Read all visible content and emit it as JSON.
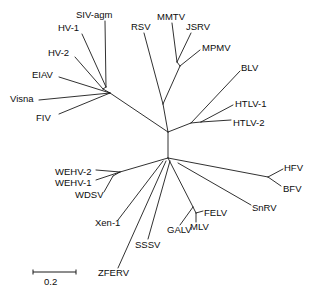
{
  "figure": {
    "type": "unrooted-phylogenetic-tree",
    "title": "",
    "width": 312,
    "height": 298,
    "background_color": "#ffffff",
    "line_color": "#1a1a1a",
    "text_color": "#0d0d0d"
  },
  "scale_bar": {
    "label": "0.2",
    "value": 0.2,
    "x1": 33,
    "x2": 76,
    "y": 272,
    "tick_height": 5,
    "label_x": 44,
    "label_y": 277
  },
  "taxa": [
    {
      "name": "SIV-agm",
      "label": "SIV-agm",
      "label_x": 76,
      "label_y": 10,
      "tip_x": 106,
      "tip_y": 87,
      "leader": [
        [
          105,
          21
        ],
        [
          106,
          87
        ]
      ]
    },
    {
      "name": "HV-1",
      "label": "HV-1",
      "label_x": 58,
      "label_y": 23,
      "tip_x": 106,
      "tip_y": 87,
      "leader": [
        [
          82,
          34
        ],
        [
          106,
          87
        ]
      ]
    },
    {
      "name": "HV-2",
      "label": "HV-2",
      "label_x": 48,
      "label_y": 48,
      "tip_x": 103,
      "tip_y": 89,
      "leader": [
        [
          75,
          57
        ],
        [
          103,
          89
        ]
      ]
    },
    {
      "name": "EIAV",
      "label": "EIAV",
      "label_x": 32,
      "label_y": 70,
      "tip_x": 110,
      "tip_y": 93,
      "leader": [
        [
          59,
          77
        ],
        [
          110,
          93
        ]
      ]
    },
    {
      "name": "Visna",
      "label": "Visna",
      "label_x": 10,
      "label_y": 94,
      "tip_x": 110,
      "tip_y": 93,
      "leader": [
        [
          39,
          100
        ],
        [
          110,
          93
        ]
      ]
    },
    {
      "name": "FIV",
      "label": "FIV",
      "label_x": 36,
      "label_y": 113,
      "tip_x": 110,
      "tip_y": 93,
      "leader": [
        [
          59,
          114
        ],
        [
          110,
          93
        ]
      ]
    },
    {
      "name": "RSV",
      "label": "RSV",
      "label_x": 131,
      "label_y": 22,
      "tip_x": 163,
      "tip_y": 104,
      "leader": [
        [
          144,
          33
        ],
        [
          163,
          104
        ]
      ]
    },
    {
      "name": "MMTV",
      "label": "MMTV",
      "label_x": 157,
      "label_y": 12,
      "tip_x": 177,
      "tip_y": 62,
      "leader": [
        [
          172,
          23
        ],
        [
          177,
          62
        ]
      ]
    },
    {
      "name": "JSRV",
      "label": "JSRV",
      "label_x": 186,
      "label_y": 22,
      "tip_x": 177,
      "tip_y": 62,
      "leader": [
        [
          191,
          33
        ],
        [
          177,
          62
        ]
      ]
    },
    {
      "name": "MPMV",
      "label": "MPMV",
      "label_x": 202,
      "label_y": 43,
      "tip_x": 180,
      "tip_y": 66,
      "leader": [
        [
          200,
          50
        ],
        [
          180,
          66
        ]
      ]
    },
    {
      "name": "BLV",
      "label": "BLV",
      "label_x": 241,
      "label_y": 63,
      "tip_x": 191,
      "tip_y": 123,
      "leader": [
        [
          240,
          71
        ],
        [
          191,
          123
        ]
      ]
    },
    {
      "name": "HTLV-1",
      "label": "HTLV-1",
      "label_x": 235,
      "label_y": 99,
      "tip_x": 201,
      "tip_y": 122,
      "leader": [
        [
          233,
          105
        ],
        [
          201,
          122
        ]
      ]
    },
    {
      "name": "HTLV-2",
      "label": "HTLV-2",
      "label_x": 233,
      "label_y": 118,
      "tip_x": 201,
      "tip_y": 122,
      "leader": [
        [
          231,
          120
        ],
        [
          201,
          122
        ]
      ]
    },
    {
      "name": "HFV",
      "label": "HFV",
      "label_x": 284,
      "label_y": 163,
      "tip_x": 268,
      "tip_y": 177,
      "leader": [
        [
          283,
          169
        ],
        [
          268,
          177
        ]
      ]
    },
    {
      "name": "BFV",
      "label": "BFV",
      "label_x": 283,
      "label_y": 184,
      "tip_x": 268,
      "tip_y": 177,
      "leader": [
        [
          281,
          186
        ],
        [
          268,
          177
        ]
      ]
    },
    {
      "name": "SnRV",
      "label": "SnRV",
      "label_x": 252,
      "label_y": 203,
      "tip_x": 178,
      "tip_y": 163,
      "leader": [
        [
          251,
          205
        ],
        [
          178,
          163
        ]
      ]
    },
    {
      "name": "FELV",
      "label": "FELV",
      "label_x": 204,
      "label_y": 208,
      "tip_x": 196,
      "tip_y": 213,
      "leader": [
        [
          203,
          211
        ],
        [
          196,
          213
        ]
      ]
    },
    {
      "name": "MLV",
      "label": "MLV",
      "label_x": 190,
      "label_y": 222,
      "tip_x": 196,
      "tip_y": 213,
      "leader": [
        [
          196,
          222
        ],
        [
          196,
          213
        ]
      ]
    },
    {
      "name": "GALV",
      "label": "GALV",
      "label_x": 167,
      "label_y": 225,
      "tip_x": 193,
      "tip_y": 207,
      "leader": [
        [
          180,
          225
        ],
        [
          193,
          207
        ]
      ]
    },
    {
      "name": "SSSV",
      "label": "SSSV",
      "label_x": 135,
      "label_y": 240,
      "tip_x": 170,
      "tip_y": 161,
      "leader": [
        [
          148,
          239
        ],
        [
          170,
          161
        ]
      ]
    },
    {
      "name": "ZFERV",
      "label": "ZFERV",
      "label_x": 98,
      "label_y": 268,
      "tip_x": 166,
      "tip_y": 161,
      "leader": [
        [
          118,
          268
        ],
        [
          166,
          161
        ]
      ]
    },
    {
      "name": "Xen-1",
      "label": "Xen-1",
      "label_x": 95,
      "label_y": 218,
      "tip_x": 163,
      "tip_y": 161,
      "leader": [
        [
          118,
          220
        ],
        [
          163,
          161
        ]
      ]
    },
    {
      "name": "WDSV",
      "label": "WDSV",
      "label_x": 75,
      "label_y": 190,
      "tip_x": 113,
      "tip_y": 176,
      "leader": [
        [
          104,
          192
        ],
        [
          113,
          176
        ]
      ]
    },
    {
      "name": "WEHV-1",
      "label": "WEHV-1",
      "label_x": 55,
      "label_y": 178,
      "tip_x": 120,
      "tip_y": 172,
      "leader": [
        [
          96,
          180
        ],
        [
          120,
          172
        ]
      ]
    },
    {
      "name": "WEHV-2",
      "label": "WEHV-2",
      "label_x": 55,
      "label_y": 167,
      "tip_x": 120,
      "tip_y": 172,
      "leader": [
        [
          96,
          170
        ],
        [
          120,
          172
        ]
      ]
    }
  ],
  "internal_branches": [
    {
      "name": "root-to-lentivirus",
      "from": [
        168,
        132
      ],
      "to": [
        110,
        93
      ]
    },
    {
      "name": "lenti-hiv-stem",
      "from": [
        110,
        93
      ],
      "to": [
        103,
        89
      ]
    },
    {
      "name": "hiv-siv-stem",
      "from": [
        103,
        89
      ],
      "to": [
        106,
        87
      ]
    },
    {
      "name": "root-to-alpharetro",
      "from": [
        168,
        132
      ],
      "to": [
        163,
        104
      ]
    },
    {
      "name": "alpha-to-betaretro",
      "from": [
        163,
        104
      ],
      "to": [
        180,
        66
      ]
    },
    {
      "name": "beta-mmtv-jsrv",
      "from": [
        180,
        66
      ],
      "to": [
        177,
        62
      ]
    },
    {
      "name": "root-to-deltaretro",
      "from": [
        168,
        132
      ],
      "to": [
        191,
        123
      ]
    },
    {
      "name": "delta-htlv-stem",
      "from": [
        191,
        123
      ],
      "to": [
        201,
        122
      ]
    },
    {
      "name": "root-to-lower-hub",
      "from": [
        168,
        132
      ],
      "to": [
        168,
        158
      ]
    },
    {
      "name": "hub-to-spuma",
      "from": [
        168,
        158
      ],
      "to": [
        268,
        177
      ]
    },
    {
      "name": "hub-to-epsilon",
      "from": [
        168,
        158
      ],
      "to": [
        120,
        172
      ]
    },
    {
      "name": "epsilon-wdsv-stem",
      "from": [
        120,
        172
      ],
      "to": [
        113,
        176
      ]
    },
    {
      "name": "hub-to-gamma",
      "from": [
        168,
        158
      ],
      "to": [
        193,
        207
      ]
    },
    {
      "name": "gamma-mlv-felv-stem",
      "from": [
        193,
        207
      ],
      "to": [
        196,
        213
      ]
    }
  ],
  "nodes": {
    "root": [
      168,
      132
    ],
    "lower_hub": [
      168,
      158
    ],
    "lentivirus": [
      110,
      93
    ],
    "alpharetro": [
      163,
      104
    ],
    "betaretro": [
      180,
      66
    ],
    "deltaretro": [
      191,
      123
    ],
    "spumavirus": [
      268,
      177
    ],
    "epsilonretro": [
      120,
      172
    ],
    "gammaretro": [
      193,
      207
    ]
  }
}
